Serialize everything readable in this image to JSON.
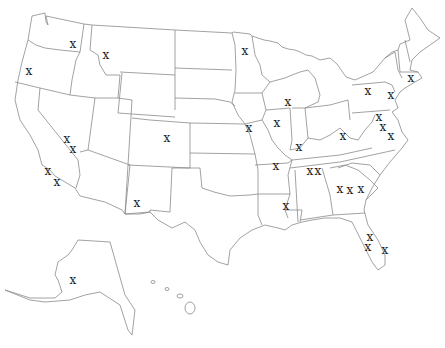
{
  "map": {
    "title": "United States",
    "marker_label": "x",
    "marker_color": "#222222",
    "border_color": "#8a8a8a",
    "markers": [
      {
        "region": "Washington",
        "x": 73,
        "y": 45
      },
      {
        "region": "Idaho",
        "x": 106,
        "y": 56
      },
      {
        "region": "Oregon",
        "x": 29,
        "y": 72
      },
      {
        "region": "Minnesota",
        "x": 245,
        "y": 52
      },
      {
        "region": "Illinois-north",
        "x": 288,
        "y": 103
      },
      {
        "region": "Pennsylvania-west",
        "x": 368,
        "y": 92
      },
      {
        "region": "Pennsylvania-east",
        "x": 391,
        "y": 96
      },
      {
        "region": "Connecticut",
        "x": 411,
        "y": 79
      },
      {
        "region": "Nevada-1",
        "x": 67,
        "y": 140
      },
      {
        "region": "Nevada-2",
        "x": 73,
        "y": 150
      },
      {
        "region": "California-1",
        "x": 48,
        "y": 172
      },
      {
        "region": "California-2",
        "x": 57,
        "y": 183
      },
      {
        "region": "Colorado",
        "x": 167,
        "y": 139
      },
      {
        "region": "Missouri",
        "x": 249,
        "y": 129
      },
      {
        "region": "Illinois-central",
        "x": 277,
        "y": 124
      },
      {
        "region": "Kentucky-west",
        "x": 299,
        "y": 148
      },
      {
        "region": "West Virginia",
        "x": 343,
        "y": 137
      },
      {
        "region": "Virginia-1",
        "x": 379,
        "y": 118
      },
      {
        "region": "Virginia-2",
        "x": 383,
        "y": 128
      },
      {
        "region": "Virginia-3",
        "x": 391,
        "y": 137
      },
      {
        "region": "Arkansas",
        "x": 276,
        "y": 167
      },
      {
        "region": "Tennessee-1",
        "x": 310,
        "y": 172
      },
      {
        "region": "Tennessee-2",
        "x": 318,
        "y": 172
      },
      {
        "region": "Georgia-1",
        "x": 340,
        "y": 190
      },
      {
        "region": "Georgia-2",
        "x": 350,
        "y": 191
      },
      {
        "region": "South Carolina",
        "x": 361,
        "y": 190
      },
      {
        "region": "Mississippi",
        "x": 286,
        "y": 207
      },
      {
        "region": "Florida-1",
        "x": 370,
        "y": 238
      },
      {
        "region": "Florida-2",
        "x": 368,
        "y": 248
      },
      {
        "region": "Florida-3",
        "x": 385,
        "y": 251
      },
      {
        "region": "New Mexico",
        "x": 137,
        "y": 204
      },
      {
        "region": "Alaska",
        "x": 73,
        "y": 281
      }
    ]
  }
}
